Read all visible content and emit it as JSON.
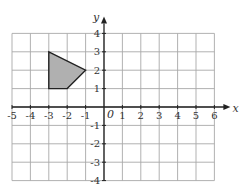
{
  "diagram": {
    "type": "coordinate-grid",
    "x_axis": {
      "label": "x",
      "min": -5,
      "max": 6,
      "tick_labels": [
        "-5",
        "-4",
        "-3",
        "-2",
        "-1",
        "1",
        "2",
        "3",
        "4",
        "5",
        "6"
      ]
    },
    "y_axis": {
      "label": "y",
      "min": -4,
      "max": 4,
      "tick_labels": [
        "4",
        "3",
        "2",
        "1",
        "-1",
        "-2",
        "-3",
        "-4"
      ]
    },
    "origin_label": "0",
    "shape": {
      "name": "shaded quadrilateral",
      "fill": "#b0b0b0",
      "vertices": [
        [
          -3,
          3
        ],
        [
          -1,
          2
        ],
        [
          -2,
          1
        ],
        [
          -3,
          1
        ]
      ]
    },
    "colors": {
      "grid": "#a8a8a8",
      "axis": "#222222"
    }
  }
}
